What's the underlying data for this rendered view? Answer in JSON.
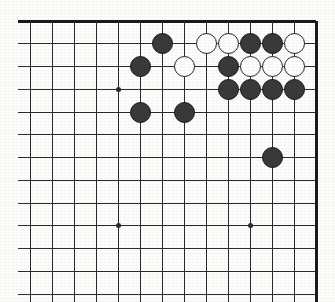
{
  "figure": {
    "name": "go-board-diagram",
    "board_size": 19,
    "region": "top-right corner"
  },
  "geometry": {
    "origin_x": 30,
    "origin_y": 21,
    "spacing_x": 22.0,
    "spacing_y": 22.75,
    "cols": 14,
    "rows": 13,
    "line_overhang_left": 12,
    "line_overhang_bottom": 8,
    "stone_diameter": 21
  },
  "colors": {
    "line": "#2b2b2b",
    "edge": "#1a1a1a",
    "black_stone": "#3a3a3a",
    "black_stone_edge": "#171717",
    "white_stone": "#fdfdfd",
    "white_stone_edge": "#232323",
    "background": "#fdfdfb"
  },
  "hoshi": [
    {
      "col": 4,
      "row": 3
    },
    {
      "col": 4,
      "row": 9
    },
    {
      "col": 10,
      "row": 9
    }
  ],
  "stones": [
    {
      "color": "black",
      "col": 6,
      "row": 1
    },
    {
      "color": "white",
      "col": 8,
      "row": 1
    },
    {
      "color": "white",
      "col": 9,
      "row": 1
    },
    {
      "color": "black",
      "col": 10,
      "row": 1
    },
    {
      "color": "black",
      "col": 11,
      "row": 1
    },
    {
      "color": "white",
      "col": 12,
      "row": 1
    },
    {
      "color": "black",
      "col": 5,
      "row": 2
    },
    {
      "color": "white",
      "col": 7,
      "row": 2
    },
    {
      "color": "black",
      "col": 9,
      "row": 2
    },
    {
      "color": "white",
      "col": 10,
      "row": 2
    },
    {
      "color": "white",
      "col": 11,
      "row": 2
    },
    {
      "color": "white",
      "col": 12,
      "row": 2
    },
    {
      "color": "black",
      "col": 9,
      "row": 3
    },
    {
      "color": "black",
      "col": 10,
      "row": 3
    },
    {
      "color": "black",
      "col": 11,
      "row": 3
    },
    {
      "color": "black",
      "col": 12,
      "row": 3
    },
    {
      "color": "black",
      "col": 5,
      "row": 4
    },
    {
      "color": "black",
      "col": 7,
      "row": 4
    },
    {
      "color": "black",
      "col": 11,
      "row": 6
    }
  ]
}
